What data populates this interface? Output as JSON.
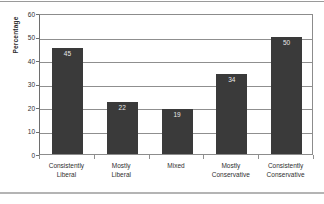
{
  "chart_data": {
    "type": "bar",
    "title": "",
    "xlabel": "",
    "ylabel": "Percentage",
    "categories": [
      "Consistently Liberal",
      "Mostly Liberal",
      "Mixed",
      "Mostly Conservative",
      "Consistently Conservative"
    ],
    "category_lines": [
      [
        "Consistently",
        "Liberal"
      ],
      [
        "Mostly",
        "Liberal"
      ],
      [
        "Mixed",
        ""
      ],
      [
        "Mostly",
        "Conservative"
      ],
      [
        "Consistently",
        "Conservative"
      ]
    ],
    "values": [
      45,
      22,
      19,
      34,
      50
    ],
    "value_labels": [
      "45",
      "22",
      "19",
      "34",
      "50"
    ],
    "ylim": [
      0,
      60
    ],
    "yticks": [
      0,
      10,
      20,
      30,
      40,
      50,
      60
    ],
    "ytick_labels": [
      "0",
      "10",
      "20",
      "30",
      "40",
      "50",
      "60"
    ],
    "grid": true,
    "legend": null,
    "bar_color": "#3a3a3a",
    "value_label_color": "#e8e8e8",
    "gridline_color": "#8f8f8f",
    "axis_color": "#6e6e6e",
    "background": "#ffffff"
  }
}
